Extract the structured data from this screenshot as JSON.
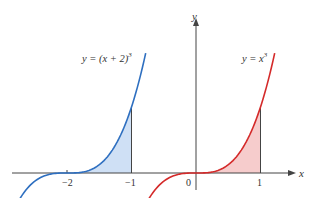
{
  "diagram": {
    "axes": {
      "x_label": "x",
      "y_label": "y",
      "origin_label": "0",
      "ticks": [
        {
          "value": -2,
          "label": "−2"
        },
        {
          "value": -1,
          "label": "−1"
        },
        {
          "value": 1,
          "label": "1"
        }
      ]
    },
    "curves": [
      {
        "name": "shifted-cubic",
        "equation_prefix": "y = (x + 2)",
        "exponent": "3",
        "color": "#2e6fc0",
        "fill": "#cfe0f5",
        "shaded_interval": [
          -2,
          -1
        ],
        "domain": [
          -2.85,
          -0.78
        ]
      },
      {
        "name": "cubic",
        "equation_prefix": "y = x",
        "exponent": "3",
        "color": "#d42a2a",
        "fill": "#f6cccc",
        "shaded_interval": [
          0,
          1
        ],
        "domain": [
          -0.85,
          1.22
        ]
      }
    ],
    "colors": {
      "axis": "#444444",
      "background": "#ffffff"
    }
  }
}
